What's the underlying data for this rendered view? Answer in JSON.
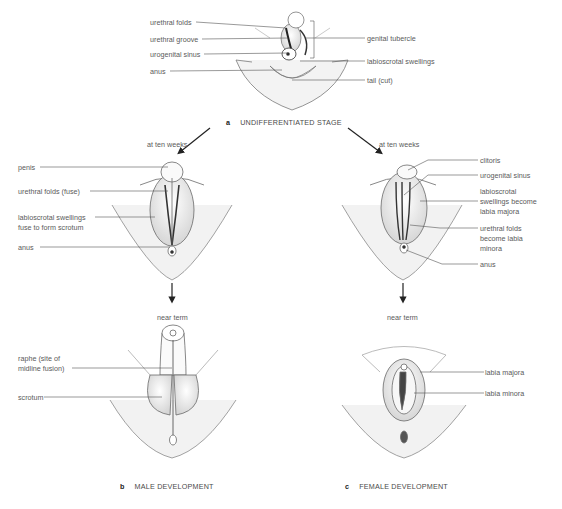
{
  "panel_a": {
    "letter": "a",
    "caption": "UNDIFFERENTIATED STAGE",
    "labels_left": [
      "urethral folds",
      "urethral groove",
      "urogenital sinus",
      "anus"
    ],
    "labels_right": [
      "genital tubercle",
      "labioscrotal swellings",
      "tail (cut)"
    ]
  },
  "panel_b": {
    "letter": "b",
    "caption": "MALE DEVELOPMENT",
    "stage1_title": "at ten weeks",
    "stage1_labels": [
      "penis",
      "urethral folds (fuse)",
      "labioscrotal swellings",
      "fuse to form scrotum",
      "anus"
    ],
    "stage2_title": "near term",
    "stage2_labels": [
      "raphe (site of",
      "midline fusion)",
      "scrotum"
    ]
  },
  "panel_c": {
    "letter": "c",
    "caption": "FEMALE DEVELOPMENT",
    "stage1_title": "at ten weeks",
    "stage1_labels": [
      "clitoris",
      "urogenital sinus",
      "labioscrotal",
      "swellings become",
      "labia majora",
      "urethral folds",
      "become labia",
      "minora",
      "anus"
    ],
    "stage2_title": "near term",
    "stage2_labels": [
      "labia majora",
      "labia minora"
    ]
  },
  "colors": {
    "line": "#555555",
    "sketch": "#8a8a8a",
    "shade": "#c9c9c9",
    "text": "#5a5a5a"
  }
}
